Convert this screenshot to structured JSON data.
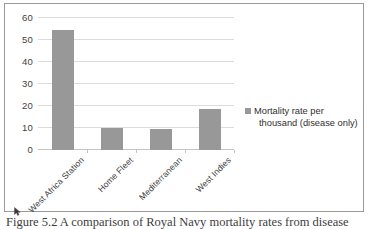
{
  "chart_data": {
    "type": "bar",
    "title": "",
    "xlabel": "",
    "ylabel": "",
    "categories": [
      "West Africa Station",
      "Home Fleet",
      "Mediterranean",
      "West Indies"
    ],
    "values": [
      54.5,
      10.2,
      9.5,
      18.5
    ],
    "series": [
      {
        "name": "Mortality rate per thousand (disease only)",
        "values": [
          54.5,
          10.2,
          9.5,
          18.5
        ]
      }
    ],
    "ylim": [
      0,
      60
    ],
    "yticks": [
      0,
      10,
      20,
      30,
      40,
      50,
      60
    ],
    "ytick_labels": [
      "0",
      "10",
      "20",
      "30",
      "40",
      "50",
      "60"
    ],
    "grid": true,
    "legend_position": "right",
    "bar_color": "#989898",
    "gridline_color": "#dcdcdc"
  },
  "legend": {
    "entries": [
      {
        "label": "Mortality rate per thousand (disease only)",
        "color": "#989898"
      }
    ]
  },
  "caption": {
    "text": "Figure 5.2  A comparison of Royal Navy mortality rates from disease"
  }
}
